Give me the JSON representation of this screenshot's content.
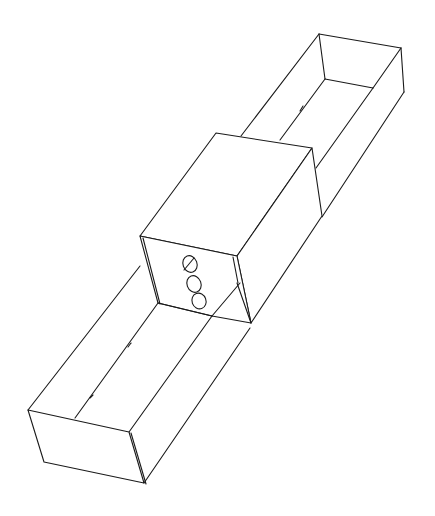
{
  "figure": {
    "type": "isometric line drawing",
    "colors": {
      "background": "#ffffff",
      "stroke": "#1a1a1a"
    },
    "parts": [
      {
        "name": "upper-tray",
        "description": "open-top tray extending to the upper right"
      },
      {
        "name": "center-sleeve",
        "description": "closed rectangular sleeve in the middle"
      },
      {
        "name": "lower-tray",
        "description": "open-top tray extending to the lower left"
      },
      {
        "name": "holes",
        "count": 3,
        "description": "three oval holes on the sleeve front face"
      }
    ]
  }
}
